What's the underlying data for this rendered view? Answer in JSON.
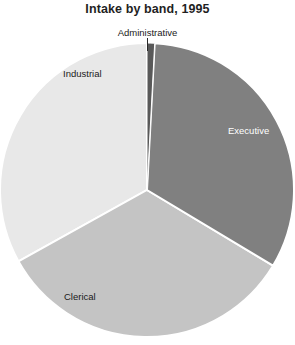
{
  "chart_data": {
    "type": "pie",
    "title": "Intake by band, 1995",
    "xlabel": "",
    "ylabel": "",
    "legend": "none",
    "grid": false,
    "start_angle_deg": 0,
    "direction": "clockwise",
    "categories": [
      "Administrative",
      "Executive",
      "Clerical",
      "Industrial"
    ],
    "values": [
      0.8,
      32.8,
      33.3,
      33.1
    ],
    "units": "percent",
    "slices": [
      {
        "label": "Administrative",
        "value": 0.8,
        "angle_deg": 3,
        "start_deg": 0,
        "end_deg": 3,
        "color": "#595959",
        "label_color": "#1a1a1a",
        "label_placement": "outside-top",
        "has_leader_line": true
      },
      {
        "label": "Executive",
        "value": 32.8,
        "angle_deg": 118,
        "start_deg": 3,
        "end_deg": 121,
        "color": "#808080",
        "label_color": "#ffffff",
        "label_placement": "inside-right",
        "has_leader_line": false
      },
      {
        "label": "Clerical",
        "value": 33.3,
        "angle_deg": 120,
        "start_deg": 121,
        "end_deg": 241,
        "color": "#c4c4c4",
        "label_color": "#1a1a1a",
        "label_placement": "inside-bottom-left",
        "has_leader_line": false
      },
      {
        "label": "Industrial",
        "value": 33.1,
        "angle_deg": 119,
        "start_deg": 241,
        "end_deg": 360,
        "color": "#e8e8e8",
        "label_color": "#1a1a1a",
        "label_placement": "inside-top-left",
        "has_leader_line": false
      }
    ],
    "separator_color": "#ffffff",
    "background_color": "#ffffff",
    "center": {
      "x": 147,
      "y": 190
    },
    "radius": 147
  },
  "labels": {
    "administrative": "Administrative",
    "executive": "Executive",
    "clerical": "Clerical",
    "industrial": "Industrial"
  }
}
